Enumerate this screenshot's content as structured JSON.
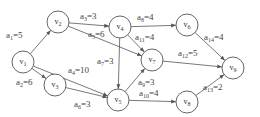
{
  "graph": {
    "type": "directed-weighted",
    "nodes": [
      {
        "id": "v1",
        "label": "v",
        "sub": "1",
        "x": 23,
        "y": 62
      },
      {
        "id": "v2",
        "label": "v",
        "sub": "2",
        "x": 58,
        "y": 22
      },
      {
        "id": "v3",
        "label": "v",
        "sub": "3",
        "x": 55,
        "y": 85
      },
      {
        "id": "v4",
        "label": "v",
        "sub": "4",
        "x": 120,
        "y": 27
      },
      {
        "id": "v5",
        "label": "v",
        "sub": "5",
        "x": 118,
        "y": 100
      },
      {
        "id": "v6",
        "label": "v",
        "sub": "6",
        "x": 187,
        "y": 25
      },
      {
        "id": "v7",
        "label": "v",
        "sub": "7",
        "x": 152,
        "y": 60
      },
      {
        "id": "v8",
        "label": "v",
        "sub": "8",
        "x": 187,
        "y": 102
      },
      {
        "id": "v9",
        "label": "v",
        "sub": "9",
        "x": 233,
        "y": 68
      }
    ],
    "edges": [
      {
        "id": "a1",
        "from": "v1",
        "to": "v2",
        "name": "a",
        "sub": "1",
        "weight": "=5",
        "lx": 6,
        "ly": 38
      },
      {
        "id": "a2",
        "from": "v1",
        "to": "v3",
        "name": "a",
        "sub": "2",
        "weight": "=6",
        "lx": 16,
        "ly": 85
      },
      {
        "id": "a3",
        "from": "v2",
        "to": "v4",
        "name": "a",
        "sub": "3",
        "weight": "=3",
        "lx": 80,
        "ly": 19
      },
      {
        "id": "a4",
        "from": "v1",
        "to": "v5",
        "name": "a",
        "sub": "4",
        "weight": "=10",
        "lx": 68,
        "ly": 73
      },
      {
        "id": "a5",
        "from": "v2",
        "to": "v7",
        "name": "a",
        "sub": "5",
        "weight": "=6",
        "lx": 88,
        "ly": 37
      },
      {
        "id": "a6",
        "from": "v3",
        "to": "v5",
        "name": "a",
        "sub": "6",
        "weight": "=3",
        "lx": 74,
        "ly": 107
      },
      {
        "id": "a7",
        "from": "v4",
        "to": "v5",
        "name": "a",
        "sub": "7",
        "weight": "=3",
        "lx": 97,
        "ly": 64
      },
      {
        "id": "a8",
        "from": "v4",
        "to": "v6",
        "name": "a",
        "sub": "8",
        "weight": "=4",
        "lx": 137,
        "ly": 20
      },
      {
        "id": "a9",
        "from": "v5",
        "to": "v7",
        "name": "a",
        "sub": "9",
        "weight": "=3",
        "lx": 138,
        "ly": 85
      },
      {
        "id": "a10",
        "from": "v5",
        "to": "v8",
        "name": "a",
        "sub": "10",
        "weight": "=4",
        "lx": 139,
        "ly": 96
      },
      {
        "id": "a11",
        "from": "v4",
        "to": "v7",
        "name": "a",
        "sub": "11",
        "weight": "=4",
        "lx": 135,
        "ly": 40
      },
      {
        "id": "a12",
        "from": "v7",
        "to": "v9",
        "name": "a",
        "sub": "12",
        "weight": "=5",
        "lx": 178,
        "ly": 56
      },
      {
        "id": "a13",
        "from": "v8",
        "to": "v9",
        "name": "a",
        "sub": "13",
        "weight": "=2",
        "lx": 203,
        "ly": 90
      },
      {
        "id": "a14",
        "from": "v6",
        "to": "v9",
        "name": "a",
        "sub": "14",
        "weight": "=4",
        "lx": 204,
        "ly": 40
      }
    ],
    "node_radius": 11,
    "colors": {
      "stroke": "#555555",
      "text": "#333333",
      "background": "#ffffff"
    }
  }
}
